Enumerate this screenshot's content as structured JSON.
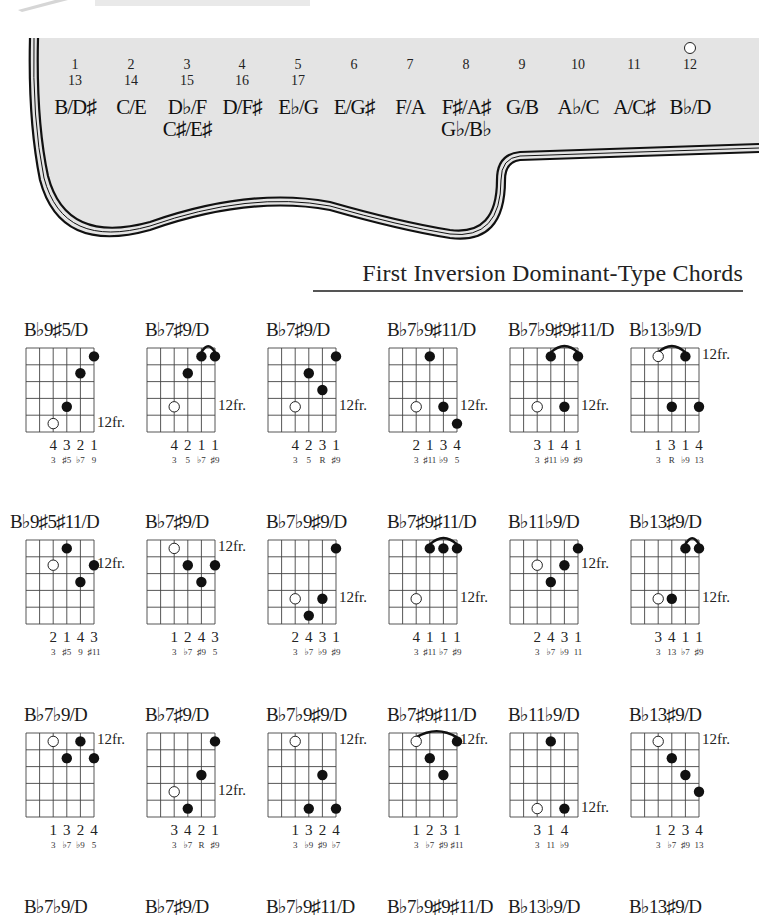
{
  "header": {
    "partial_title": "...",
    "fretboard_pairs": [
      {
        "fret": "1",
        "fret2": "13",
        "notes": [
          "B/D♯"
        ]
      },
      {
        "fret": "2",
        "fret2": "14",
        "notes": [
          "C/E"
        ]
      },
      {
        "fret": "3",
        "fret2": "15",
        "notes": [
          "D♭/F",
          "C♯/E♯"
        ]
      },
      {
        "fret": "4",
        "fret2": "16",
        "notes": [
          "D/F♯"
        ]
      },
      {
        "fret": "5",
        "fret2": "17",
        "notes": [
          "E♭/G"
        ]
      },
      {
        "fret": "6",
        "fret2": "",
        "notes": [
          "E/G♯"
        ]
      },
      {
        "fret": "7",
        "fret2": "",
        "notes": [
          "F/A"
        ]
      },
      {
        "fret": "8",
        "fret2": "",
        "notes": [
          "F♯/A♯",
          "G♭/B♭"
        ]
      },
      {
        "fret": "9",
        "fret2": "",
        "notes": [
          "G/B"
        ]
      },
      {
        "fret": "10",
        "fret2": "",
        "notes": [
          "A♭/C"
        ]
      },
      {
        "fret": "11",
        "fret2": "",
        "notes": [
          "A/C♯"
        ]
      },
      {
        "fret": "12",
        "fret2": "",
        "notes": [
          "B♭/D"
        ],
        "marker": "open-circle"
      }
    ]
  },
  "section": {
    "title": "First Inversion Dominant-Type Chords"
  },
  "chord_rows": [
    {
      "chords": [
        {
          "name": "B♭9♯5/D",
          "fret_label": "12fr.",
          "fret_label_row": 4,
          "dots": [
            {
              "s": 5,
              "f": 0,
              "t": "filled"
            },
            {
              "s": 4,
              "f": 1,
              "t": "filled"
            },
            {
              "s": 3,
              "f": 3,
              "t": "filled"
            },
            {
              "s": 2,
              "f": 4,
              "t": "open"
            }
          ],
          "slur": null,
          "fingers": [
            "4",
            "3",
            "2",
            "1"
          ],
          "intervals": [
            "3",
            "♯5",
            "♭7",
            "9"
          ]
        },
        {
          "name": "B♭7♯9/D",
          "fret_label": "12fr.",
          "fret_label_row": 3,
          "dots": [
            {
              "s": 4,
              "f": 0,
              "t": "filled"
            },
            {
              "s": 5,
              "f": 0,
              "t": "filled"
            },
            {
              "s": 3,
              "f": 1,
              "t": "filled"
            },
            {
              "s": 2,
              "f": 3,
              "t": "open"
            }
          ],
          "slur": [
            4,
            5
          ],
          "fingers": [
            "4",
            "2",
            "1",
            "1"
          ],
          "intervals": [
            "3",
            "5",
            "♭7",
            "♯9"
          ]
        },
        {
          "name": "B♭7♯9/D",
          "fret_label": "12fr.",
          "fret_label_row": 3,
          "dots": [
            {
              "s": 5,
              "f": 0,
              "t": "filled"
            },
            {
              "s": 3,
              "f": 1,
              "t": "filled"
            },
            {
              "s": 4,
              "f": 2,
              "t": "filled"
            },
            {
              "s": 2,
              "f": 3,
              "t": "open"
            }
          ],
          "slur": null,
          "fingers": [
            "4",
            "2",
            "3",
            "1"
          ],
          "intervals": [
            "3",
            "5",
            "R",
            "♯9"
          ]
        },
        {
          "name": "B♭7♭9♯11/D",
          "fret_label": "12fr.",
          "fret_label_row": 3,
          "dots": [
            {
              "s": 3,
              "f": 0,
              "t": "filled"
            },
            {
              "s": 2,
              "f": 3,
              "t": "open"
            },
            {
              "s": 4,
              "f": 3,
              "t": "filled"
            },
            {
              "s": 5,
              "f": 4,
              "t": "filled"
            }
          ],
          "slur": null,
          "fingers": [
            "2",
            "1",
            "3",
            "4"
          ],
          "intervals": [
            "3",
            "♯11",
            "♭9",
            "5"
          ]
        },
        {
          "name": "B♭7♭9♯9♯11/D",
          "fret_label": "12fr.",
          "fret_label_row": 3,
          "dots": [
            {
              "s": 3,
              "f": 0,
              "t": "filled"
            },
            {
              "s": 5,
              "f": 0,
              "t": "filled"
            },
            {
              "s": 2,
              "f": 3,
              "t": "open"
            },
            {
              "s": 4,
              "f": 3,
              "t": "filled"
            }
          ],
          "slur": [
            3,
            5
          ],
          "fingers": [
            "3",
            "1",
            "4",
            "1"
          ],
          "intervals": [
            "3",
            "♯11",
            "♭9",
            "♯9"
          ]
        },
        {
          "name": "B♭13♭9/D",
          "fret_label": "12fr.",
          "fret_label_row": 0,
          "dots": [
            {
              "s": 2,
              "f": 0,
              "t": "open"
            },
            {
              "s": 4,
              "f": 0,
              "t": "filled"
            },
            {
              "s": 3,
              "f": 3,
              "t": "filled"
            },
            {
              "s": 5,
              "f": 3,
              "t": "filled"
            }
          ],
          "slur": [
            2,
            4
          ],
          "fingers": [
            "1",
            "3",
            "1",
            "4"
          ],
          "intervals": [
            "3",
            "R",
            "♭9",
            "13"
          ]
        }
      ]
    },
    {
      "chords": [
        {
          "name": "B♭9♯5♯11/D",
          "fret_label": "12fr.",
          "fret_label_row": 1,
          "dots": [
            {
              "s": 3,
              "f": 0,
              "t": "filled"
            },
            {
              "s": 2,
              "f": 1,
              "t": "open"
            },
            {
              "s": 5,
              "f": 1,
              "t": "filled"
            },
            {
              "s": 4,
              "f": 2,
              "t": "filled"
            }
          ],
          "slur": null,
          "fingers": [
            "2",
            "1",
            "4",
            "3"
          ],
          "intervals": [
            "3",
            "♯5",
            "9",
            "♯11"
          ]
        },
        {
          "name": "B♭7♯9/D",
          "fret_label": "12fr.",
          "fret_label_row": 0,
          "dots": [
            {
              "s": 2,
              "f": 0,
              "t": "open"
            },
            {
              "s": 3,
              "f": 1,
              "t": "filled"
            },
            {
              "s": 5,
              "f": 1,
              "t": "filled"
            },
            {
              "s": 4,
              "f": 2,
              "t": "filled"
            }
          ],
          "slur": null,
          "fingers": [
            "1",
            "2",
            "4",
            "3"
          ],
          "intervals": [
            "3",
            "♭7",
            "♯9",
            "5"
          ]
        },
        {
          "name": "B♭7♭9♯9/D",
          "fret_label": "12fr.",
          "fret_label_row": 3,
          "dots": [
            {
              "s": 5,
              "f": 0,
              "t": "filled"
            },
            {
              "s": 2,
              "f": 3,
              "t": "open"
            },
            {
              "s": 4,
              "f": 3,
              "t": "filled"
            },
            {
              "s": 3,
              "f": 4,
              "t": "filled"
            }
          ],
          "slur": null,
          "fingers": [
            "2",
            "4",
            "3",
            "1"
          ],
          "intervals": [
            "3",
            "♭7",
            "♭9",
            "♯9"
          ]
        },
        {
          "name": "B♭7♯9♯11/D",
          "fret_label": "12fr.",
          "fret_label_row": 3,
          "dots": [
            {
              "s": 3,
              "f": 0,
              "t": "filled"
            },
            {
              "s": 4,
              "f": 0,
              "t": "filled"
            },
            {
              "s": 5,
              "f": 0,
              "t": "filled"
            },
            {
              "s": 2,
              "f": 3,
              "t": "open"
            }
          ],
          "slur": [
            3,
            5
          ],
          "fingers": [
            "4",
            "1",
            "1",
            "1"
          ],
          "intervals": [
            "3",
            "♯11",
            "♭7",
            "♯9"
          ]
        },
        {
          "name": "B♭11♭9/D",
          "fret_label": "12fr.",
          "fret_label_row": 1,
          "dots": [
            {
              "s": 5,
              "f": 0,
              "t": "filled"
            },
            {
              "s": 2,
              "f": 1,
              "t": "open"
            },
            {
              "s": 4,
              "f": 1,
              "t": "filled"
            },
            {
              "s": 3,
              "f": 2,
              "t": "filled"
            }
          ],
          "slur": null,
          "fingers": [
            "2",
            "4",
            "3",
            "1"
          ],
          "intervals": [
            "3",
            "♭7",
            "♭9",
            "11"
          ]
        },
        {
          "name": "B♭13♯9/D",
          "fret_label": "12fr.",
          "fret_label_row": 3,
          "dots": [
            {
              "s": 4,
              "f": 0,
              "t": "filled"
            },
            {
              "s": 5,
              "f": 0,
              "t": "filled"
            },
            {
              "s": 2,
              "f": 3,
              "t": "open"
            },
            {
              "s": 3,
              "f": 3,
              "t": "filled"
            }
          ],
          "slur": [
            4,
            5
          ],
          "fingers": [
            "3",
            "4",
            "1",
            "1"
          ],
          "intervals": [
            "3",
            "13",
            "♭7",
            "♯9"
          ]
        }
      ]
    },
    {
      "chords": [
        {
          "name": "B♭7♭9/D",
          "fret_label": "12fr.",
          "fret_label_row": 0,
          "dots": [
            {
              "s": 2,
              "f": 0,
              "t": "open"
            },
            {
              "s": 4,
              "f": 0,
              "t": "filled"
            },
            {
              "s": 3,
              "f": 1,
              "t": "filled"
            },
            {
              "s": 5,
              "f": 1,
              "t": "filled"
            }
          ],
          "slur": null,
          "fingers": [
            "1",
            "3",
            "2",
            "4"
          ],
          "intervals": [
            "3",
            "♭7",
            "♭9",
            "5"
          ]
        },
        {
          "name": "B♭7♯9/D",
          "fret_label": "12fr.",
          "fret_label_row": 3,
          "dots": [
            {
              "s": 5,
              "f": 0,
              "t": "filled"
            },
            {
              "s": 4,
              "f": 2,
              "t": "filled"
            },
            {
              "s": 2,
              "f": 3,
              "t": "open"
            },
            {
              "s": 3,
              "f": 4,
              "t": "filled"
            }
          ],
          "slur": null,
          "fingers": [
            "3",
            "4",
            "2",
            "1"
          ],
          "intervals": [
            "3",
            "♭7",
            "R",
            "♯9"
          ]
        },
        {
          "name": "B♭7♭9♯9/D",
          "fret_label": "12fr.",
          "fret_label_row": 0,
          "dots": [
            {
              "s": 2,
              "f": 0,
              "t": "open"
            },
            {
              "s": 4,
              "f": 2,
              "t": "filled"
            },
            {
              "s": 3,
              "f": 4,
              "t": "filled"
            },
            {
              "s": 5,
              "f": 4,
              "t": "filled"
            }
          ],
          "slur": null,
          "fingers": [
            "1",
            "3",
            "2",
            "4"
          ],
          "intervals": [
            "3",
            "♭9",
            "♯9",
            "♭7"
          ]
        },
        {
          "name": "B♭7♯9♯11/D",
          "fret_label": "12fr.",
          "fret_label_row": 0,
          "dots": [
            {
              "s": 2,
              "f": 0,
              "t": "open"
            },
            {
              "s": 5,
              "f": 0,
              "t": "filled"
            },
            {
              "s": 3,
              "f": 1,
              "t": "filled"
            },
            {
              "s": 4,
              "f": 2,
              "t": "filled"
            }
          ],
          "slur": [
            2,
            5
          ],
          "fingers": [
            "1",
            "2",
            "3",
            "1"
          ],
          "intervals": [
            "3",
            "♭7",
            "♯9",
            "♯11"
          ]
        },
        {
          "name": "B♭11♭9/D",
          "fret_label": "12fr.",
          "fret_label_row": 4,
          "dots": [
            {
              "s": 3,
              "f": 0,
              "t": "filled"
            },
            {
              "s": 2,
              "f": 4,
              "t": "open"
            },
            {
              "s": 4,
              "f": 4,
              "t": "filled"
            }
          ],
          "slur": null,
          "fingers": [
            "3",
            "1",
            "4"
          ],
          "intervals": [
            "3",
            "11",
            "♭9"
          ]
        },
        {
          "name": "B♭13♯9/D",
          "fret_label": "12fr.",
          "fret_label_row": 0,
          "dots": [
            {
              "s": 2,
              "f": 0,
              "t": "open"
            },
            {
              "s": 3,
              "f": 1,
              "t": "filled"
            },
            {
              "s": 4,
              "f": 2,
              "t": "filled"
            },
            {
              "s": 5,
              "f": 3,
              "t": "filled"
            }
          ],
          "slur": null,
          "fingers": [
            "1",
            "2",
            "3",
            "4"
          ],
          "intervals": [
            "3",
            "♭7",
            "♯9",
            "13"
          ]
        }
      ]
    },
    {
      "chords": [
        {
          "name": "B♭7♭9/D"
        },
        {
          "name": "B♭7♯9/D"
        },
        {
          "name": "B♭7♭9♯11/D"
        },
        {
          "name": "B♭7♭9♯9♯11/D"
        },
        {
          "name": "B♭13♭9/D"
        },
        {
          "name": "B♭13♯9/D"
        }
      ]
    }
  ],
  "colors": {
    "guitar_fill": "#e4e4e4",
    "outline": "#111111",
    "ink": "#1a1a1a"
  }
}
